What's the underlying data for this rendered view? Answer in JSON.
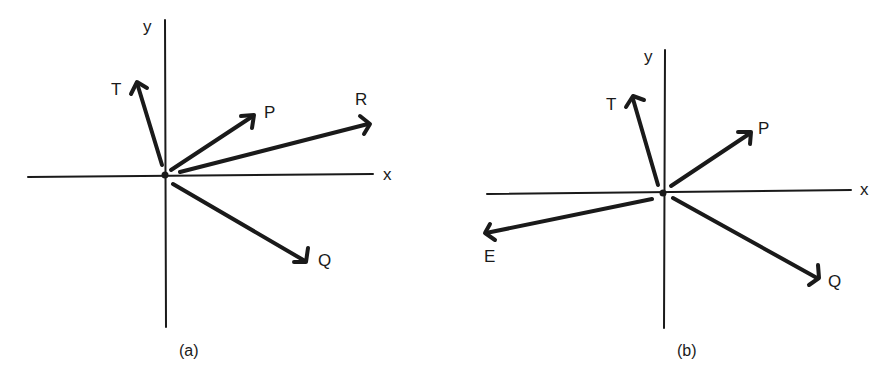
{
  "colors": {
    "ink": "#1a1a1a",
    "background": "#ffffff"
  },
  "panels": [
    {
      "id": "a",
      "caption": "(a)",
      "axis_labels": {
        "x": "x",
        "y": "y"
      },
      "vectors": [
        {
          "name": "T",
          "label": "T"
        },
        {
          "name": "P",
          "label": "P"
        },
        {
          "name": "R",
          "label": "R"
        },
        {
          "name": "Q",
          "label": "Q"
        }
      ]
    },
    {
      "id": "b",
      "caption": "(b)",
      "axis_labels": {
        "x": "x",
        "y": "y"
      },
      "vectors": [
        {
          "name": "T",
          "label": "T"
        },
        {
          "name": "P",
          "label": "P"
        },
        {
          "name": "E",
          "label": "E"
        },
        {
          "name": "Q",
          "label": "Q"
        }
      ]
    }
  ]
}
